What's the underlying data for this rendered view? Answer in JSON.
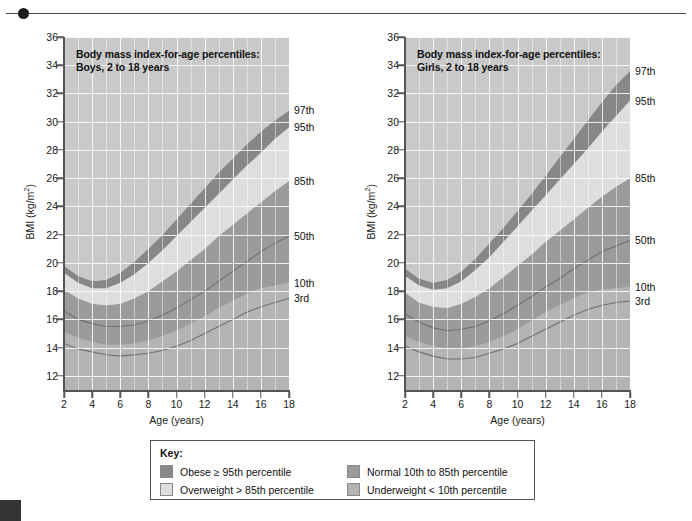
{
  "figure": {
    "credit": "Understanding Nutrition, 12th ed, Whitney & Rolfes, Chapter 16, Fig. 16-10, p. 550."
  },
  "key": {
    "title": "Key:",
    "items": [
      {
        "label": "Obese ≥ 95th percentile",
        "color": "#878787"
      },
      {
        "label": "Overweight > 85th percentile",
        "color": "#dedede"
      },
      {
        "label": "Normal 10th to 85th percentile",
        "color": "#9b9b9b"
      },
      {
        "label": "Underweight < 10th percentile",
        "color": "#b4b4b4"
      }
    ]
  },
  "charts": [
    {
      "id": "boys",
      "title": "Body mass index-for-age percentiles:\nBoys, 2 to 18 years",
      "title_line1": "Body mass index-for-age percentiles:",
      "title_line2": "Boys, 2 to 18 years",
      "xlabel": "Age (years)",
      "ylabel_pre": "BMI (kg/m",
      "ylabel_sup": "2",
      "ylabel_post": ")",
      "xticks": [
        2,
        4,
        6,
        8,
        10,
        12,
        14,
        16,
        18
      ],
      "yticks": [
        12,
        14,
        16,
        18,
        20,
        22,
        24,
        26,
        28,
        30,
        32,
        34,
        36
      ],
      "xlim": [
        2,
        18
      ],
      "ylim": [
        11,
        36
      ],
      "percentile_labels": [
        {
          "text": "97th",
          "value": 30.8
        },
        {
          "text": "95th",
          "value": 29.6
        },
        {
          "text": "85th",
          "value": 25.8
        },
        {
          "text": "50th",
          "value": 21.9
        },
        {
          "text": "10th",
          "value": 18.6
        },
        {
          "text": "3rd",
          "value": 17.5
        }
      ]
    },
    {
      "id": "girls",
      "title": "Body mass index-for-age percentiles:\nGirls, 2 to 18 years",
      "title_line1": "Body mass index-for-age percentiles:",
      "title_line2": "Girls, 2 to 18 years",
      "xlabel": "Age (years)",
      "ylabel_pre": "BMI (kg/m",
      "ylabel_sup": "2",
      "ylabel_post": ")",
      "xticks": [
        2,
        4,
        6,
        8,
        10,
        12,
        14,
        16,
        18
      ],
      "yticks": [
        12,
        14,
        16,
        18,
        20,
        22,
        24,
        26,
        28,
        30,
        32,
        34,
        36
      ],
      "xlim": [
        2,
        18
      ],
      "ylim": [
        11,
        36
      ],
      "percentile_labels": [
        {
          "text": "97th",
          "value": 33.6
        },
        {
          "text": "95th",
          "value": 31.5
        },
        {
          "text": "85th",
          "value": 26.0
        },
        {
          "text": "50th",
          "value": 21.6
        },
        {
          "text": "10th",
          "value": 18.3
        },
        {
          "text": "3rd",
          "value": 17.3
        }
      ]
    }
  ],
  "chart_data": [
    {
      "type": "area",
      "id": "boys",
      "title": "Body mass index-for-age percentiles: Boys, 2 to 18 years",
      "xlabel": "Age (years)",
      "ylabel": "BMI (kg/m2)",
      "xlim": [
        2,
        18
      ],
      "ylim": [
        11,
        36
      ],
      "grid": true,
      "legend": "right-side percentile labels",
      "x": [
        2,
        3,
        4,
        5,
        6,
        7,
        8,
        9,
        10,
        11,
        12,
        13,
        14,
        15,
        16,
        17,
        18
      ],
      "series": [
        {
          "name": "3rd",
          "values": [
            14.3,
            13.9,
            13.7,
            13.5,
            13.4,
            13.5,
            13.6,
            13.8,
            14.1,
            14.5,
            15.0,
            15.5,
            16.0,
            16.5,
            16.9,
            17.2,
            17.5
          ]
        },
        {
          "name": "10th",
          "values": [
            15.1,
            14.7,
            14.4,
            14.2,
            14.2,
            14.3,
            14.5,
            14.8,
            15.2,
            15.7,
            16.2,
            16.8,
            17.3,
            17.8,
            18.2,
            18.4,
            18.6
          ]
        },
        {
          "name": "50th",
          "values": [
            16.6,
            16.0,
            15.7,
            15.5,
            15.5,
            15.6,
            15.9,
            16.3,
            16.8,
            17.4,
            18.0,
            18.7,
            19.4,
            20.1,
            20.8,
            21.4,
            21.9
          ]
        },
        {
          "name": "85th",
          "values": [
            18.1,
            17.5,
            17.1,
            17.0,
            17.1,
            17.5,
            18.0,
            18.7,
            19.4,
            20.2,
            21.0,
            21.9,
            22.7,
            23.5,
            24.3,
            25.1,
            25.8
          ]
        },
        {
          "name": "95th",
          "values": [
            19.3,
            18.6,
            18.2,
            18.2,
            18.6,
            19.2,
            20.0,
            20.9,
            21.9,
            22.9,
            23.9,
            24.9,
            25.9,
            26.9,
            27.8,
            28.8,
            29.6
          ]
        },
        {
          "name": "97th",
          "values": [
            19.8,
            19.1,
            18.7,
            18.8,
            19.3,
            20.1,
            21.0,
            22.0,
            23.1,
            24.2,
            25.3,
            26.4,
            27.4,
            28.4,
            29.3,
            30.1,
            30.8
          ]
        }
      ],
      "bands": [
        {
          "name": "Underweight < 10th percentile",
          "between": [
            "bottom",
            "10th"
          ],
          "color": "#b4b4b4"
        },
        {
          "name": "Normal 10th to 85th percentile",
          "between": [
            "10th",
            "85th"
          ],
          "color": "#9b9b9b"
        },
        {
          "name": "Overweight > 85th percentile",
          "between": [
            "85th",
            "95th"
          ],
          "color": "#dedede"
        },
        {
          "name": "Obese ≥ 95th percentile",
          "between": [
            "95th",
            "97th"
          ],
          "color": "#878787"
        }
      ]
    },
    {
      "type": "area",
      "id": "girls",
      "title": "Body mass index-for-age percentiles: Girls, 2 to 18 years",
      "xlabel": "Age (years)",
      "ylabel": "BMI (kg/m2)",
      "xlim": [
        2,
        18
      ],
      "ylim": [
        11,
        36
      ],
      "grid": true,
      "legend": "right-side percentile labels",
      "x": [
        2,
        3,
        4,
        5,
        6,
        7,
        8,
        9,
        10,
        11,
        12,
        13,
        14,
        15,
        16,
        17,
        18
      ],
      "series": [
        {
          "name": "3rd",
          "values": [
            14.1,
            13.7,
            13.4,
            13.2,
            13.2,
            13.3,
            13.6,
            13.9,
            14.3,
            14.8,
            15.3,
            15.8,
            16.3,
            16.7,
            17.0,
            17.2,
            17.3
          ]
        },
        {
          "name": "10th",
          "values": [
            14.8,
            14.4,
            14.1,
            13.9,
            13.9,
            14.1,
            14.4,
            14.8,
            15.3,
            15.9,
            16.5,
            17.0,
            17.5,
            17.9,
            18.1,
            18.2,
            18.3
          ]
        },
        {
          "name": "50th",
          "values": [
            16.4,
            15.8,
            15.4,
            15.2,
            15.3,
            15.5,
            15.9,
            16.4,
            17.0,
            17.6,
            18.3,
            18.9,
            19.6,
            20.2,
            20.8,
            21.2,
            21.6
          ]
        },
        {
          "name": "85th",
          "values": [
            17.9,
            17.2,
            16.9,
            16.8,
            17.1,
            17.6,
            18.2,
            19.0,
            19.8,
            20.6,
            21.5,
            22.3,
            23.1,
            23.9,
            24.7,
            25.4,
            26.0
          ]
        },
        {
          "name": "95th",
          "values": [
            19.1,
            18.4,
            18.1,
            18.2,
            18.7,
            19.5,
            20.4,
            21.5,
            22.6,
            23.7,
            24.8,
            25.9,
            27.0,
            28.1,
            29.3,
            30.4,
            31.5
          ]
        },
        {
          "name": "97th",
          "values": [
            19.6,
            18.9,
            18.6,
            18.8,
            19.4,
            20.3,
            21.4,
            22.5,
            23.7,
            24.9,
            26.2,
            27.5,
            28.8,
            30.1,
            31.4,
            32.6,
            33.6
          ]
        }
      ],
      "bands": [
        {
          "name": "Underweight < 10th percentile",
          "between": [
            "bottom",
            "10th"
          ],
          "color": "#b4b4b4"
        },
        {
          "name": "Normal 10th to 85th percentile",
          "between": [
            "10th",
            "85th"
          ],
          "color": "#9b9b9b"
        },
        {
          "name": "Overweight > 85th percentile",
          "between": [
            "85th",
            "95th"
          ],
          "color": "#dedede"
        },
        {
          "name": "Obese ≥ 95th percentile",
          "between": [
            "95th",
            "97th"
          ],
          "color": "#878787"
        }
      ]
    }
  ]
}
